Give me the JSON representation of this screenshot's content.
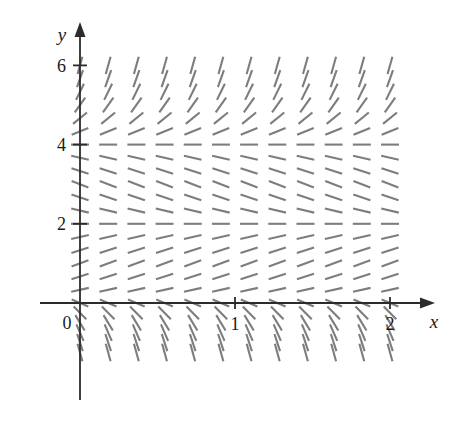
{
  "figure": {
    "kind": "slope-field",
    "background": "#ffffff",
    "axis_color": "#2b2b2b",
    "segment_color": "#7d7d7d"
  },
  "axes": {
    "x_label": "x",
    "y_label": "y",
    "origin_label": "0",
    "x_ticks": [
      {
        "label": "1",
        "value": 1
      },
      {
        "label": "2",
        "value": 2
      }
    ],
    "y_ticks": [
      {
        "label": "2",
        "value": 2
      },
      {
        "label": "4",
        "value": 4
      },
      {
        "label": "6",
        "value": 6
      }
    ]
  },
  "chart_data": {
    "type": "scatter",
    "title": "",
    "xlabel": "x",
    "ylabel": "y",
    "xlim": [
      0,
      2.25
    ],
    "ylim": [
      -1.5,
      6.5
    ],
    "grid": false,
    "legend": null,
    "equation_description": "Slope field of an autonomous differential equation dy/dx = f(y) with equilibrium solutions at y = 2 and y = 4; slopes positive for 0 < y < 2 and y > 4, negative for 2 < y < 4 and y < 0.",
    "x_tick_values": [
      1,
      2
    ],
    "y_tick_values": [
      2,
      4,
      6
    ],
    "x_samples": [
      0.0,
      0.1818,
      0.3636,
      0.5455,
      0.7273,
      0.9091,
      1.0909,
      1.2727,
      1.4545,
      1.6364,
      1.8182,
      2.0
    ],
    "y_samples": [
      -1.25,
      -1.0,
      -0.75,
      -0.5,
      -0.25,
      0.0,
      0.3333,
      0.6667,
      1.0,
      1.3333,
      1.6667,
      2.0,
      2.3333,
      2.6667,
      3.0,
      3.3333,
      3.6667,
      4.0,
      4.3333,
      4.6667,
      5.0,
      5.3333,
      5.6667,
      6.0
    ],
    "slope_by_y": [
      {
        "y": -1.25,
        "slope": -14.0
      },
      {
        "y": -1.0,
        "slope": -12.0
      },
      {
        "y": -0.75,
        "slope": -9.0
      },
      {
        "y": -0.5,
        "slope": -6.5
      },
      {
        "y": -0.25,
        "slope": -4.0
      },
      {
        "y": 0.0,
        "slope": -1.6
      },
      {
        "y": 0.3333,
        "slope": 0.85
      },
      {
        "y": 0.6667,
        "slope": 1.25
      },
      {
        "y": 1.0,
        "slope": 1.45
      },
      {
        "y": 1.3333,
        "slope": 1.25
      },
      {
        "y": 1.6667,
        "slope": 0.85
      },
      {
        "y": 2.0,
        "slope": 0.0
      },
      {
        "y": 2.3333,
        "slope": -0.9
      },
      {
        "y": 2.6667,
        "slope": -1.3
      },
      {
        "y": 3.0,
        "slope": -1.5
      },
      {
        "y": 3.3333,
        "slope": -1.3
      },
      {
        "y": 3.6667,
        "slope": -0.9
      },
      {
        "y": 4.0,
        "slope": 0.0
      },
      {
        "y": 4.3333,
        "slope": 1.6
      },
      {
        "y": 4.6667,
        "slope": 3.2
      },
      {
        "y": 5.0,
        "slope": 5.5
      },
      {
        "y": 5.3333,
        "slope": 8.0
      },
      {
        "y": 5.6667,
        "slope": 11.0
      },
      {
        "y": 6.0,
        "slope": 14.0
      }
    ]
  }
}
